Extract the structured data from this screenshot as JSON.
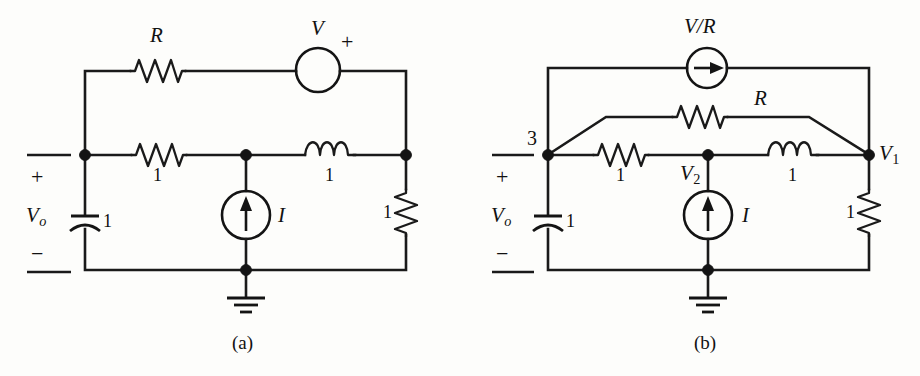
{
  "figure": {
    "width": 920,
    "height": 376,
    "background_color": "#fdfdfb",
    "ink_color": "#141414"
  },
  "panels": [
    {
      "id": "a",
      "caption": "(a)",
      "caption_pos": {
        "x": 246,
        "y": 338
      },
      "terminal_labels": {
        "plus": "+",
        "minus": "−",
        "source_name": "V",
        "source_sub": "o"
      },
      "components": [
        {
          "name": "top-resistor-R",
          "type": "resistor",
          "orientation": "horizontal",
          "label": "R",
          "label_pos": {
            "x": 148,
            "y": 28
          },
          "center": {
            "x": 157,
            "y": 70
          }
        },
        {
          "name": "voltage-source-V",
          "type": "voltage-source",
          "label": "V",
          "polarity": "+",
          "center": {
            "x": 318,
            "y": 70
          },
          "radius": 22
        },
        {
          "name": "series-resistor-1",
          "type": "resistor",
          "orientation": "horizontal",
          "label": "1",
          "label_pos": {
            "x": 155,
            "y": 168
          },
          "center": {
            "x": 158,
            "y": 155
          }
        },
        {
          "name": "inductor-1",
          "type": "inductor",
          "orientation": "horizontal",
          "label": "1",
          "label_pos": {
            "x": 327,
            "y": 168
          },
          "center": {
            "x": 330,
            "y": 155
          }
        },
        {
          "name": "capacitor-1",
          "type": "capacitor",
          "orientation": "vertical",
          "label": "1",
          "label_pos": {
            "x": 99,
            "y": 213
          },
          "center": {
            "x": 85,
            "y": 222
          }
        },
        {
          "name": "current-source-I",
          "type": "current-source",
          "label": "I",
          "direction": "up",
          "center": {
            "x": 246,
            "y": 215
          },
          "radius": 24
        },
        {
          "name": "load-resistor-1",
          "type": "resistor",
          "orientation": "vertical",
          "label": "1",
          "label_pos": {
            "x": 384,
            "y": 203
          },
          "center": {
            "x": 406,
            "y": 211
          }
        }
      ],
      "nodes": [
        {
          "name": "node-top-left",
          "x": 85,
          "y": 155
        },
        {
          "name": "node-middle",
          "x": 246,
          "y": 155
        },
        {
          "name": "node-right",
          "x": 406,
          "y": 155
        },
        {
          "name": "node-ground",
          "x": 246,
          "y": 270
        }
      ]
    },
    {
      "id": "b",
      "caption": "(b)",
      "caption_pos": {
        "x": 708,
        "y": 338
      },
      "terminal_labels": {
        "plus": "+",
        "minus": "−",
        "source_name": "V",
        "source_sub": "o"
      },
      "node_labels": [
        {
          "name": "node-label-3",
          "text": "3",
          "x": 531,
          "y": 133
        },
        {
          "name": "node-label-v1",
          "text": "V",
          "sub": "1",
          "x": 879,
          "y": 145
        },
        {
          "name": "node-label-v2",
          "text": "V",
          "sub": "2",
          "x": 685,
          "y": 166
        }
      ],
      "components": [
        {
          "name": "current-source-VoverR",
          "type": "current-source",
          "label": "V/R",
          "direction": "right",
          "center": {
            "x": 707,
            "y": 68
          },
          "radius": 20,
          "label_pos": {
            "x": 707,
            "y": 24
          }
        },
        {
          "name": "bridge-resistor-R",
          "type": "resistor",
          "orientation": "horizontal",
          "label": "R",
          "label_pos": {
            "x": 760,
            "y": 94
          },
          "center": {
            "x": 707,
            "y": 117
          }
        },
        {
          "name": "series-resistor-1",
          "type": "resistor",
          "orientation": "horizontal",
          "label": "1",
          "label_pos": {
            "x": 618,
            "y": 168
          },
          "center": {
            "x": 620,
            "y": 155
          }
        },
        {
          "name": "inductor-1",
          "type": "inductor",
          "orientation": "horizontal",
          "label": "1",
          "label_pos": {
            "x": 790,
            "y": 168
          },
          "center": {
            "x": 793,
            "y": 155
          }
        },
        {
          "name": "capacitor-1",
          "type": "capacitor",
          "orientation": "vertical",
          "label": "1",
          "label_pos": {
            "x": 562,
            "y": 213
          },
          "center": {
            "x": 548,
            "y": 222
          }
        },
        {
          "name": "current-source-I",
          "type": "current-source",
          "label": "I",
          "direction": "up",
          "center": {
            "x": 708,
            "y": 215
          },
          "radius": 24
        },
        {
          "name": "load-resistor-1",
          "type": "resistor",
          "orientation": "vertical",
          "label": "1",
          "label_pos": {
            "x": 847,
            "y": 203
          },
          "center": {
            "x": 869,
            "y": 211
          }
        }
      ],
      "nodes": [
        {
          "name": "node-3",
          "x": 548,
          "y": 155
        },
        {
          "name": "node-v2",
          "x": 708,
          "y": 155
        },
        {
          "name": "node-v1",
          "x": 869,
          "y": 155
        },
        {
          "name": "node-ground",
          "x": 708,
          "y": 270
        }
      ]
    }
  ]
}
